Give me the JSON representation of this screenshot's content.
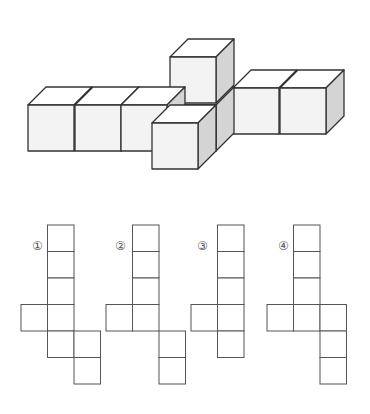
{
  "figure": {
    "colors": {
      "front": "#f3f3f3",
      "top": "#ffffff",
      "side": "#d4d4d4",
      "stroke": "#333333",
      "net_stroke": "#555555"
    }
  },
  "cube_figure": {
    "cube_count": 9,
    "cubes": [
      {
        "id": "top-stack",
        "x": 170,
        "y": 57
      },
      {
        "id": "left-1",
        "x": 28,
        "y": 105
      },
      {
        "id": "left-2",
        "x": 75,
        "y": 105
      },
      {
        "id": "left-3",
        "x": 121,
        "y": 105
      },
      {
        "id": "center-back",
        "x": 170,
        "y": 105
      },
      {
        "id": "right-1",
        "x": 233,
        "y": 88
      },
      {
        "id": "right-2",
        "x": 280,
        "y": 88
      },
      {
        "id": "front",
        "x": 152,
        "y": 123
      }
    ]
  },
  "options": [
    {
      "label": "①",
      "cells": [
        [
          1,
          0
        ],
        [
          1,
          1
        ],
        [
          1,
          2
        ],
        [
          0,
          3
        ],
        [
          1,
          3
        ],
        [
          1,
          4
        ],
        [
          2,
          4
        ],
        [
          2,
          5
        ]
      ],
      "origin_x": 21
    },
    {
      "label": "②",
      "cells": [
        [
          1,
          0
        ],
        [
          1,
          1
        ],
        [
          1,
          2
        ],
        [
          0,
          3
        ],
        [
          1,
          3
        ],
        [
          2,
          4
        ],
        [
          2,
          5
        ]
      ],
      "origin_x": 106
    },
    {
      "label": "③",
      "cells": [
        [
          1,
          0
        ],
        [
          1,
          1
        ],
        [
          1,
          2
        ],
        [
          0,
          3
        ],
        [
          1,
          3
        ],
        [
          1,
          4
        ]
      ],
      "origin_x": 191
    },
    {
      "label": "④",
      "cells": [
        [
          1,
          0
        ],
        [
          1,
          1
        ],
        [
          1,
          2
        ],
        [
          0,
          3
        ],
        [
          1,
          3
        ],
        [
          2,
          3
        ],
        [
          2,
          4
        ],
        [
          2,
          5
        ]
      ],
      "origin_x": 267
    }
  ]
}
